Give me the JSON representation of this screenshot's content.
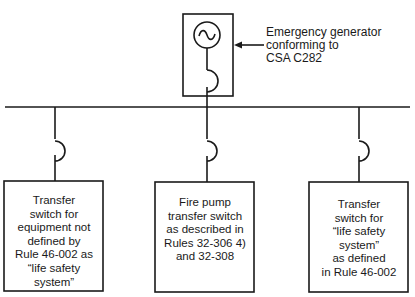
{
  "generator": {
    "label_lines": [
      "Emergency generator",
      "conforming to",
      "CSA C282"
    ],
    "symbol": "ac-sine-icon"
  },
  "branches": [
    {
      "id": "left",
      "text_lines": [
        "Transfer",
        "switch for",
        "equipment not",
        "defined by",
        "Rule 46-002 as",
        "“life safety",
        "system”"
      ]
    },
    {
      "id": "middle",
      "text_lines": [
        "Fire pump",
        "transfer switch",
        "as described in",
        "Rules 32-306 4)",
        "and 32-308"
      ]
    },
    {
      "id": "right",
      "text_lines": [
        "Transfer",
        "switch for",
        "“life safety",
        "system”",
        "as defined",
        "in Rule 46-002"
      ]
    }
  ],
  "colors": {
    "line": "#1a1a1a",
    "background": "#ffffff"
  }
}
